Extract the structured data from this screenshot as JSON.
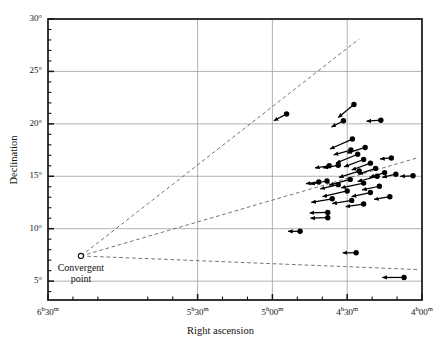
{
  "chart_data": {
    "type": "scatter",
    "title": "",
    "xlabel": "Right ascension",
    "ylabel": "Declination",
    "grid": true,
    "legend": "none",
    "xlim_hours": [
      6.5,
      4.0
    ],
    "ylim_deg": [
      3.2,
      30.0
    ],
    "x_axis": {
      "label": "Right ascension",
      "direction": "decreasing",
      "ticks": [
        {
          "value": 6.5,
          "label": "6h30m",
          "label_h": "6",
          "label_sup_h": "h",
          "label_m": "30",
          "label_sup_m": "m"
        },
        {
          "value": 5.5,
          "label": "5h30m",
          "label_h": "5",
          "label_sup_h": "h",
          "label_m": "30",
          "label_sup_m": "m"
        },
        {
          "value": 5.0,
          "label": "5h00m",
          "label_h": "5",
          "label_sup_h": "h",
          "label_m": "00",
          "label_sup_m": "m"
        },
        {
          "value": 4.5,
          "label": "4h30m",
          "label_h": "4",
          "label_sup_h": "h",
          "label_m": "30",
          "label_sup_m": "m"
        },
        {
          "value": 4.0,
          "label": "4h00m",
          "label_h": "4",
          "label_sup_h": "h",
          "label_m": "00",
          "label_sup_m": "m"
        }
      ],
      "minor_tick_interval_minutes": 10
    },
    "y_axis": {
      "label": "Declination",
      "ticks": [
        {
          "value": 5,
          "label": "5°"
        },
        {
          "value": 10,
          "label": "10°"
        },
        {
          "value": 15,
          "label": "15°"
        },
        {
          "value": 20,
          "label": "20°"
        },
        {
          "value": 25,
          "label": "25°"
        },
        {
          "value": 30,
          "label": "30°"
        }
      ],
      "minor_tick_interval_deg": 1
    },
    "annotations": [
      {
        "name": "convergent-point",
        "text_line1": "Convergent",
        "text_line2": "point",
        "ra_hours": 6.28,
        "dec_deg": 7.4,
        "marker": "open-circle"
      }
    ],
    "convergent_rays": [
      {
        "name": "upper-ray",
        "from": [
          6.28,
          7.4
        ],
        "to": [
          4.42,
          28.1
        ]
      },
      {
        "name": "middle-ray",
        "from": [
          6.28,
          7.4
        ],
        "to": [
          4.02,
          16.8
        ]
      },
      {
        "name": "lower-ray",
        "from": [
          6.28,
          7.4
        ],
        "to": [
          4.02,
          6.1
        ]
      }
    ],
    "points": [
      {
        "ra": 4.905,
        "dec": 20.95,
        "dra": 0.085,
        "ddec": -0.65
      },
      {
        "ra": 4.455,
        "dec": 21.85,
        "dra": 0.105,
        "ddec": -1.25
      },
      {
        "ra": 4.525,
        "dec": 20.3,
        "dra": 0.08,
        "ddec": -0.6
      },
      {
        "ra": 4.275,
        "dec": 20.35,
        "dra": 0.095,
        "ddec": -0.1
      },
      {
        "ra": 4.465,
        "dec": 18.55,
        "dra": 0.15,
        "ddec": -0.95
      },
      {
        "ra": 4.38,
        "dec": 17.75,
        "dra": 0.12,
        "ddec": -0.55
      },
      {
        "ra": 4.43,
        "dec": 17.1,
        "dra": 0.145,
        "ddec": -0.85
      },
      {
        "ra": 4.39,
        "dec": 16.6,
        "dra": 0.13,
        "ddec": -0.7
      },
      {
        "ra": 4.345,
        "dec": 16.25,
        "dra": 0.125,
        "ddec": -0.65
      },
      {
        "ra": 4.56,
        "dec": 16.05,
        "dra": 0.1,
        "ddec": -0.25
      },
      {
        "ra": 4.62,
        "dec": 16.0,
        "dra": 0.095,
        "ddec": -0.2
      },
      {
        "ra": 4.31,
        "dec": 15.75,
        "dra": 0.115,
        "ddec": -0.55
      },
      {
        "ra": 4.42,
        "dec": 15.5,
        "dra": 0.135,
        "ddec": -0.6
      },
      {
        "ra": 4.25,
        "dec": 15.35,
        "dra": 0.1,
        "ddec": -0.45
      },
      {
        "ra": 4.175,
        "dec": 15.2,
        "dra": 0.09,
        "ddec": -0.3
      },
      {
        "ra": 4.3,
        "dec": 15.0,
        "dra": 0.13,
        "ddec": -0.5
      },
      {
        "ra": 4.06,
        "dec": 15.05,
        "dra": 0.085,
        "ddec": -0.05
      },
      {
        "ra": 4.48,
        "dec": 14.7,
        "dra": 0.14,
        "ddec": -0.55
      },
      {
        "ra": 4.39,
        "dec": 14.35,
        "dra": 0.15,
        "ddec": -0.45
      },
      {
        "ra": 4.56,
        "dec": 14.2,
        "dra": 0.12,
        "ddec": -0.4
      },
      {
        "ra": 4.285,
        "dec": 14.05,
        "dra": 0.115,
        "ddec": -0.35
      },
      {
        "ra": 4.5,
        "dec": 13.6,
        "dra": 0.165,
        "ddec": -0.55
      },
      {
        "ra": 4.345,
        "dec": 13.45,
        "dra": 0.125,
        "ddec": -0.4
      },
      {
        "ra": 4.635,
        "dec": 14.55,
        "dra": 0.11,
        "ddec": -0.3
      },
      {
        "ra": 4.69,
        "dec": 14.45,
        "dra": 0.085,
        "ddec": -0.15
      },
      {
        "ra": 4.6,
        "dec": 12.85,
        "dra": 0.14,
        "ddec": -0.35
      },
      {
        "ra": 4.47,
        "dec": 12.7,
        "dra": 0.13,
        "ddec": -0.3
      },
      {
        "ra": 4.63,
        "dec": 11.55,
        "dra": 0.12,
        "ddec": -0.05
      },
      {
        "ra": 4.63,
        "dec": 11.05,
        "dra": 0.115,
        "ddec": -0.05
      },
      {
        "ra": 4.815,
        "dec": 9.75,
        "dra": 0.08,
        "ddec": 0.0
      },
      {
        "ra": 4.44,
        "dec": 7.7,
        "dra": 0.09,
        "ddec": 0.0
      },
      {
        "ra": 4.12,
        "dec": 5.35,
        "dra": 0.145,
        "ddec": 0.0
      },
      {
        "ra": 4.475,
        "dec": 17.5,
        "dra": 0.115,
        "ddec": -0.45
      },
      {
        "ra": 4.205,
        "dec": 16.75,
        "dra": 0.075,
        "ddec": -0.1
      },
      {
        "ra": 4.215,
        "dec": 13.05,
        "dra": 0.105,
        "ddec": -0.25
      },
      {
        "ra": 4.39,
        "dec": 12.35,
        "dra": 0.12,
        "ddec": -0.25
      }
    ]
  },
  "style": {
    "grid_color": "#9a9a9a",
    "frame_color": "#141414",
    "point_color": "#000000",
    "vector_color": "#000000",
    "dashed_color": "#5a5a5a",
    "background": "#ffffff"
  }
}
